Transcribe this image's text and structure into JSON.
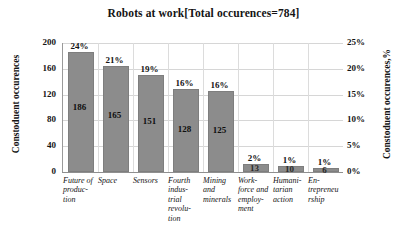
{
  "chart_data": {
    "type": "bar",
    "title": "Robots at work[Total occurences=784]",
    "xlabel": "",
    "ylabel": "Constoduent occurences",
    "ylabel_secondary": "Constoduent occurences,%",
    "total_occurrences": 784,
    "categories": [
      "Future of produc-tion",
      "Space",
      "Sensors",
      "Fourth indus-trial revolu-tion",
      "Mining and minerals",
      "Work-force and employ-ment",
      "Humani-tarian action",
      "En-trepreneurship"
    ],
    "values": [
      186,
      165,
      151,
      128,
      125,
      13,
      10,
      6
    ],
    "percent_labels": [
      "24%",
      "21%",
      "19%",
      "16%",
      "16%",
      "2%",
      "1%",
      "1%"
    ],
    "percent_values": [
      24,
      21,
      19,
      16,
      16,
      2,
      1,
      1
    ],
    "ylim": [
      0,
      200
    ],
    "yticks": [
      "0",
      "40",
      "80",
      "120",
      "160",
      "200"
    ],
    "ylim_secondary": [
      0,
      25
    ],
    "yticks_secondary": [
      "0%",
      "5%",
      "10%",
      "15%",
      "20%",
      "25%"
    ],
    "grid": true,
    "legend": "none",
    "bar_color": "#8c8c8c",
    "grid_color": "#d6d6d6",
    "text_color": "#141414"
  }
}
